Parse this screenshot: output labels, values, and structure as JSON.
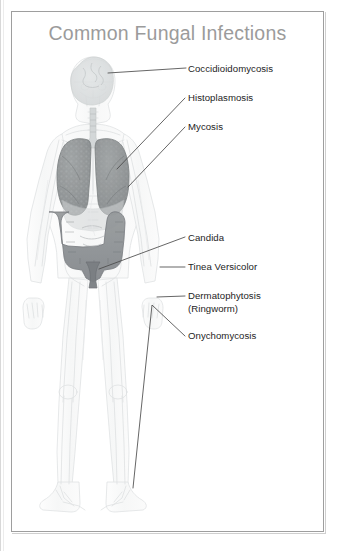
{
  "document": {
    "title": "Common Fungal Infections",
    "title_color": "#9b9b9b",
    "background_color": "#ffffff",
    "border_color": "#9e9e9e"
  },
  "figure": {
    "name": "anterior-human-anatomy-figure",
    "outline_color": "#e3e5e6",
    "organ_colors": {
      "lungs": "#8b8f91",
      "intestine": "#8e9295",
      "skull_brain": "#d7dadb",
      "soft_tissue": "#eef0f0"
    }
  },
  "leader_line_color": "#4a4a4a",
  "labels": [
    {
      "id": "coccidioidomycosis",
      "text": "Coccidioidomycosis",
      "x": 188,
      "y": 63,
      "target": "head",
      "line": [
        [
          188,
          68
        ],
        [
          108,
          72
        ]
      ]
    },
    {
      "id": "histoplasmosis",
      "text": "Histoplasmosis",
      "x": 188,
      "y": 93,
      "target": "right-lung",
      "line": [
        [
          186,
          98
        ],
        [
          118,
          168
        ]
      ]
    },
    {
      "id": "mycosis",
      "text": "Mycosis",
      "x": 188,
      "y": 122,
      "target": "left-lung",
      "line": [
        [
          186,
          127
        ],
        [
          130,
          186
        ]
      ]
    },
    {
      "id": "candida",
      "text": "Candida",
      "x": 188,
      "y": 234,
      "target": "pelvis-gut",
      "line": [
        [
          186,
          237
        ],
        [
          100,
          268
        ]
      ]
    },
    {
      "id": "tinea-versicolor",
      "text": "Tinea Versicolor",
      "x": 188,
      "y": 263,
      "target": "torso-skin",
      "line": [
        [
          186,
          267
        ],
        [
          160,
          267
        ]
      ]
    },
    {
      "id": "dermatophytosis",
      "text": "Dermatophytosis\n(Ringworm)",
      "line1": "Dermatophytosis",
      "line2": "(Ringworm)",
      "x": 188,
      "y": 291,
      "target": "hand-skin",
      "line": [
        [
          186,
          296
        ],
        [
          156,
          298
        ]
      ]
    },
    {
      "id": "onychomycosis",
      "text": "Onychomycosis",
      "x": 188,
      "y": 332,
      "target": "toenails",
      "line": [
        [
          186,
          336
        ],
        [
          152,
          305
        ],
        [
          133,
          487
        ]
      ]
    }
  ]
}
